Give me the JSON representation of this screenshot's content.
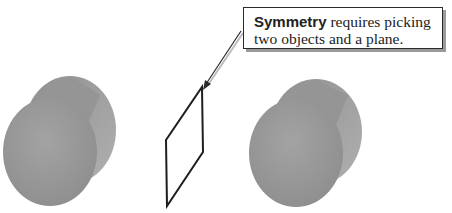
{
  "callout": {
    "bold": "Symmetry",
    "line1_rest": " requires picking",
    "line2": "two objects and a plane."
  },
  "objects": [
    {
      "name": "left-cylinder",
      "color": "#9a9a9a"
    },
    {
      "name": "symmetry-plane"
    },
    {
      "name": "right-cylinder",
      "color": "#9a9a9a"
    }
  ]
}
